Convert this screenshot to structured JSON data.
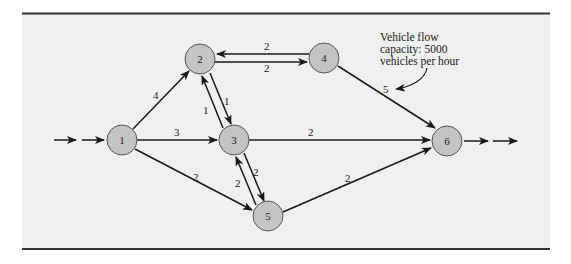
{
  "diagram": {
    "type": "network-flow",
    "colors": {
      "panel_bg": "#f0f0f0",
      "border": "#333333",
      "node_fill": "#c4c4c4",
      "node_stroke": "#555555",
      "edge": "#1a1a1a"
    },
    "nodes": [
      {
        "id": "1",
        "label": "1",
        "x": 122,
        "y": 140
      },
      {
        "id": "2",
        "label": "2",
        "x": 200,
        "y": 59
      },
      {
        "id": "3",
        "label": "3",
        "x": 234,
        "y": 140
      },
      {
        "id": "4",
        "label": "4",
        "x": 324,
        "y": 58
      },
      {
        "id": "5",
        "label": "5",
        "x": 268,
        "y": 216
      },
      {
        "id": "6",
        "label": "6",
        "x": 447,
        "y": 141
      }
    ],
    "edges": [
      {
        "from": "1",
        "to": "2",
        "capacity": "4"
      },
      {
        "from": "1",
        "to": "3",
        "capacity": "3"
      },
      {
        "from": "1",
        "to": "5",
        "capacity": "2"
      },
      {
        "from": "2",
        "to": "3",
        "capacity": "1"
      },
      {
        "from": "3",
        "to": "2",
        "capacity": "1"
      },
      {
        "from": "2",
        "to": "4",
        "capacity": "2"
      },
      {
        "from": "4",
        "to": "2",
        "capacity": "2"
      },
      {
        "from": "3",
        "to": "5",
        "capacity": "2"
      },
      {
        "from": "5",
        "to": "3",
        "capacity": "2"
      },
      {
        "from": "3",
        "to": "6",
        "capacity": "2"
      },
      {
        "from": "4",
        "to": "6",
        "capacity": "5"
      },
      {
        "from": "5",
        "to": "6",
        "capacity": "2"
      }
    ],
    "annotation": {
      "lines": [
        "Vehicle flow",
        "capacity: 5000",
        "vehicles per hour"
      ],
      "points_to_edge": "4-6"
    },
    "source_flow": "incoming arrows into node 1",
    "sink_flow": "outgoing arrows from node 6"
  }
}
